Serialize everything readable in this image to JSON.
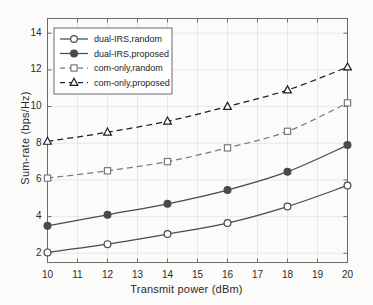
{
  "chart_data": {
    "type": "line",
    "title": "",
    "xlabel": "Transmit power (dBm)",
    "ylabel": "Sum-rate (bps/Hz)",
    "x": [
      10,
      12,
      14,
      16,
      18,
      20
    ],
    "xlim": [
      10,
      20
    ],
    "ylim": [
      1.5,
      14.8
    ],
    "xticks": [
      10,
      11,
      12,
      13,
      14,
      15,
      16,
      17,
      18,
      19,
      20
    ],
    "xtick_labels": [
      "10",
      "11",
      "12",
      "13",
      "14",
      "15",
      "16",
      "17",
      "18",
      "19",
      "20"
    ],
    "yticks": [
      2,
      4,
      6,
      8,
      10,
      12,
      14
    ],
    "ytick_labels": [
      "2",
      "4",
      "6",
      "8",
      "10",
      "12",
      "14"
    ],
    "grid": true,
    "legend_position": "upper left",
    "series": [
      {
        "name": "dual-IRS,random",
        "values": [
          2.05,
          2.5,
          3.05,
          3.65,
          4.55,
          5.7
        ],
        "linestyle": "solid",
        "marker": "circle-open",
        "color": "#4a4a4a"
      },
      {
        "name": "dual-IRS,proposed",
        "values": [
          3.5,
          4.1,
          4.7,
          5.45,
          6.45,
          7.9
        ],
        "linestyle": "solid",
        "marker": "circle-filled",
        "color": "#4a4a4a"
      },
      {
        "name": "com-only,random",
        "values": [
          6.1,
          6.5,
          7.0,
          7.75,
          8.65,
          10.2
        ],
        "linestyle": "dashed",
        "marker": "square-open",
        "color": "#7a7a7a"
      },
      {
        "name": "com-only,proposed",
        "values": [
          8.1,
          8.6,
          9.2,
          10.0,
          10.9,
          12.15
        ],
        "linestyle": "dashed",
        "marker": "triangle-open",
        "color": "#1f1f1f"
      }
    ]
  },
  "legend": {
    "entries": [
      "dual-IRS,random",
      "dual-IRS,proposed",
      "com-only,random",
      "com-only,proposed"
    ]
  }
}
